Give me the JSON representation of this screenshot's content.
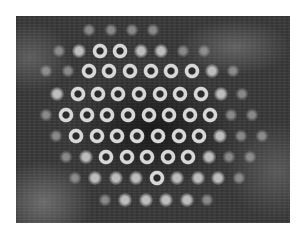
{
  "figure": {
    "frame": {
      "x": 16,
      "y": 16,
      "width": 274,
      "height": 207
    },
    "colors": {
      "background": "#3a3a3a",
      "spot": "#d8d8d8",
      "page": "#ffffff"
    },
    "rows": [
      {
        "y": 14,
        "spots": [
          {
            "x": 73,
            "t": "faint"
          },
          {
            "x": 95,
            "t": "faint"
          },
          {
            "x": 116,
            "t": "faint"
          },
          {
            "x": 137,
            "t": "faint"
          }
        ]
      },
      {
        "y": 35,
        "spots": [
          {
            "x": 43,
            "t": "faint"
          },
          {
            "x": 63,
            "t": "blob"
          },
          {
            "x": 84,
            "t": "ring"
          },
          {
            "x": 104,
            "t": "ring"
          },
          {
            "x": 125,
            "t": "blob"
          },
          {
            "x": 145,
            "t": "blob"
          },
          {
            "x": 167,
            "t": "faint"
          },
          {
            "x": 188,
            "t": "faint"
          }
        ]
      },
      {
        "y": 55,
        "spots": [
          {
            "x": 30,
            "t": "faint"
          },
          {
            "x": 52,
            "t": "faint"
          },
          {
            "x": 73,
            "t": "ring"
          },
          {
            "x": 93,
            "t": "ring"
          },
          {
            "x": 114,
            "t": "ring"
          },
          {
            "x": 135,
            "t": "ring"
          },
          {
            "x": 155,
            "t": "ring"
          },
          {
            "x": 176,
            "t": "ring"
          },
          {
            "x": 196,
            "t": "blob"
          },
          {
            "x": 217,
            "t": "faint"
          }
        ]
      },
      {
        "y": 78,
        "spots": [
          {
            "x": 41,
            "t": "blob"
          },
          {
            "x": 62,
            "t": "ring"
          },
          {
            "x": 82,
            "t": "ring"
          },
          {
            "x": 102,
            "t": "ring"
          },
          {
            "x": 123,
            "t": "ring"
          },
          {
            "x": 144,
            "t": "ring"
          },
          {
            "x": 164,
            "t": "ring"
          },
          {
            "x": 185,
            "t": "ring"
          },
          {
            "x": 205,
            "t": "blob"
          },
          {
            "x": 226,
            "t": "faint"
          }
        ]
      },
      {
        "y": 99,
        "spots": [
          {
            "x": 30,
            "t": "faint"
          },
          {
            "x": 50,
            "t": "ring"
          },
          {
            "x": 71,
            "t": "ring"
          },
          {
            "x": 91,
            "t": "ring"
          },
          {
            "x": 112,
            "t": "ring"
          },
          {
            "x": 133,
            "t": "ring"
          },
          {
            "x": 153,
            "t": "ring"
          },
          {
            "x": 174,
            "t": "ring"
          },
          {
            "x": 194,
            "t": "ring"
          },
          {
            "x": 215,
            "t": "faint"
          },
          {
            "x": 236,
            "t": "faint"
          }
        ]
      },
      {
        "y": 120,
        "spots": [
          {
            "x": 40,
            "t": "faint"
          },
          {
            "x": 60,
            "t": "ring"
          },
          {
            "x": 81,
            "t": "ring"
          },
          {
            "x": 101,
            "t": "ring"
          },
          {
            "x": 121,
            "t": "ring"
          },
          {
            "x": 142,
            "t": "ring"
          },
          {
            "x": 163,
            "t": "ring"
          },
          {
            "x": 183,
            "t": "ring"
          },
          {
            "x": 204,
            "t": "blob"
          },
          {
            "x": 225,
            "t": "faint"
          },
          {
            "x": 246,
            "t": "faint"
          }
        ]
      },
      {
        "y": 141,
        "spots": [
          {
            "x": 50,
            "t": "faint"
          },
          {
            "x": 70,
            "t": "blob"
          },
          {
            "x": 90,
            "t": "ring"
          },
          {
            "x": 111,
            "t": "ring"
          },
          {
            "x": 131,
            "t": "ring"
          },
          {
            "x": 152,
            "t": "ring"
          },
          {
            "x": 172,
            "t": "ring"
          },
          {
            "x": 193,
            "t": "blob"
          },
          {
            "x": 213,
            "t": "faint"
          },
          {
            "x": 234,
            "t": "faint"
          }
        ]
      },
      {
        "y": 162,
        "spots": [
          {
            "x": 59,
            "t": "faint"
          },
          {
            "x": 79,
            "t": "blob"
          },
          {
            "x": 100,
            "t": "blob"
          },
          {
            "x": 120,
            "t": "blob"
          },
          {
            "x": 141,
            "t": "ring"
          },
          {
            "x": 161,
            "t": "blob"
          },
          {
            "x": 182,
            "t": "blob"
          },
          {
            "x": 202,
            "t": "blob"
          },
          {
            "x": 223,
            "t": "faint"
          }
        ]
      },
      {
        "y": 184,
        "spots": [
          {
            "x": 89,
            "t": "faint"
          },
          {
            "x": 109,
            "t": "blob"
          },
          {
            "x": 130,
            "t": "blob"
          },
          {
            "x": 150,
            "t": "blob"
          },
          {
            "x": 171,
            "t": "blob"
          },
          {
            "x": 191,
            "t": "faint"
          }
        ]
      }
    ]
  }
}
